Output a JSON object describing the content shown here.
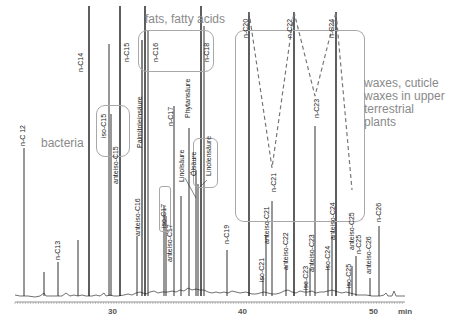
{
  "chart_data": {
    "type": "line",
    "title": "",
    "xlabel": "min",
    "ylabel": "",
    "xlim": [
      22,
      52
    ],
    "x_ticks": [
      30,
      40,
      50
    ],
    "x_unit_label": "min",
    "grid": false,
    "groups": [
      {
        "name": "bacteria",
        "label": "bacteria"
      },
      {
        "name": "fats",
        "label": "fats, fatty acids"
      },
      {
        "name": "waxes",
        "label": "waxes, cuticle waxes in upper terrestrial plants"
      }
    ],
    "peaks": [
      {
        "label": "n-C12",
        "x_px": 24,
        "height_px": 148
      },
      {
        "label": "n-C13",
        "x_px": 58,
        "height_px": 34
      },
      {
        "label": "n-C14",
        "x_px": 89,
        "height_px": 290
      },
      {
        "label": "iso-C15",
        "x_px": 109,
        "height_px": 252
      },
      {
        "label": "anteiso-C15",
        "x_px": 111,
        "height_px": 182
      },
      {
        "label": "n-C15",
        "x_px": 120,
        "height_px": 290
      },
      {
        "label": "anteiso-C16",
        "x_px": 137,
        "height_px": 60
      },
      {
        "label": "Palmitoleinsäure",
        "x_px": 142,
        "height_px": 255
      },
      {
        "label": "n-C16",
        "x_px": 145,
        "height_px": 290
      },
      {
        "label": "iso-C17",
        "x_px": 164,
        "height_px": 90
      },
      {
        "label": "anteiso-C17",
        "x_px": 166,
        "height_px": 80
      },
      {
        "label": "n-C17",
        "x_px": 174,
        "height_px": 190
      },
      {
        "label": "Linolsäure",
        "x_px": 181,
        "height_px": 100
      },
      {
        "label": "Phytansäure",
        "x_px": 189,
        "height_px": 168
      },
      {
        "label": "Ölsäure",
        "x_px": 196,
        "height_px": 125
      },
      {
        "label": "Linolensäure",
        "x_px": 198,
        "height_px": 112
      },
      {
        "label": "n-C18",
        "x_px": 201,
        "height_px": 290
      },
      {
        "label": "n-C19",
        "x_px": 227,
        "height_px": 45
      },
      {
        "label": "n-C20",
        "x_px": 249,
        "height_px": 284
      },
      {
        "label": "iso-C21",
        "x_px": 263,
        "height_px": 20
      },
      {
        "label": "anteiso-C21",
        "x_px": 266,
        "height_px": 60
      },
      {
        "label": "n-C21",
        "x_px": 272,
        "height_px": 95
      },
      {
        "label": "anteiso-C22",
        "x_px": 286,
        "height_px": 28
      },
      {
        "label": "n-C22",
        "x_px": 294,
        "height_px": 284
      },
      {
        "label": "iso-C23",
        "x_px": 306,
        "height_px": 14
      },
      {
        "label": "anteiso-C23",
        "x_px": 310,
        "height_px": 28
      },
      {
        "label": "n-C23",
        "x_px": 315,
        "height_px": 170
      },
      {
        "label": "iso-C24",
        "x_px": 328,
        "height_px": 30
      },
      {
        "label": "anteiso-C24",
        "x_px": 332,
        "height_px": 60
      },
      {
        "label": "n-C24",
        "x_px": 336,
        "height_px": 284
      },
      {
        "label": "iso-C25",
        "x_px": 349,
        "height_px": 14
      },
      {
        "label": "anteiso-C25",
        "x_px": 352,
        "height_px": 30
      },
      {
        "label": "n-C25",
        "x_px": 356,
        "height_px": 40
      },
      {
        "label": "anteiso-C26",
        "x_px": 370,
        "height_px": 18
      },
      {
        "label": "n-C26",
        "x_px": 379,
        "height_px": 70
      }
    ],
    "annotations": [
      {
        "type": "dashed-zigzag",
        "through": [
          "n-C20",
          "n-C21",
          "n-C22",
          "n-C23",
          "n-C24",
          "n-C25"
        ]
      }
    ]
  },
  "groups": {
    "bacteria": "bacteria",
    "fats": "fats, fatty acids",
    "waxes_line1": "waxes, cuticle",
    "waxes_line2": "waxes in upper",
    "waxes_line3": "terrestrial",
    "waxes_line4": "plants"
  },
  "axis": {
    "tick30": "30",
    "tick40": "40",
    "tick50": "50",
    "unit": "min"
  },
  "labels": {
    "nC12": "n-C 12",
    "nC13": "n-C13",
    "nC14": "n-C14",
    "isoC15": "iso-C15",
    "anteisoC15": "anteiso-C15",
    "nC15": "n-C15",
    "anteisoC16": "anteiso-C16",
    "palmitolein": "Palmitoleinsäure",
    "nC16": "n-C16",
    "isoC17": "iso-C17",
    "anteisoC17": "anteiso-C17",
    "nC17": "n-C17",
    "linol": "Linolsäure",
    "phytan": "Phytansäure",
    "oel": "Ölsäure",
    "linolen": "Linolensäure",
    "nC18": "n-C18",
    "nC19": "n-C19",
    "nC20": "n-C20",
    "isoC21": "iso-C21",
    "anteisoC21": "anteiso-C21",
    "nC21": "n-C21",
    "anteisoC22": "anteiso-C22",
    "nC22": "n-C22",
    "isoC23": "iso-C23",
    "anteisoC23": "anteiso-C23",
    "nC23": "n-C23",
    "isoC24": "iso-C24",
    "anteisoC24": "anteiso-C24",
    "nC24": "n-C24",
    "isoC25": "iso-C25",
    "anteisoC25": "anteiso-C25",
    "nC25": "n-C25",
    "anteisoC26": "anteiso-C26",
    "nC26": "n-C26"
  },
  "colors": {
    "trace": "#1a1a1a",
    "group_text": "#8a8a8a",
    "box": "#a8a8a8",
    "dash": "#777777"
  }
}
